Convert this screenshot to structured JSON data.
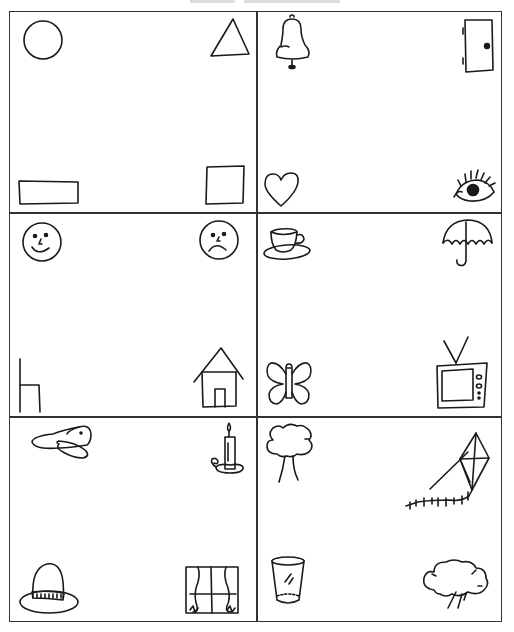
{
  "worksheet": {
    "layout": {
      "rows": 3,
      "columns": 2
    },
    "cells": [
      {
        "position": "row1-left",
        "items": [
          {
            "corner": "top-left",
            "name": "circle"
          },
          {
            "corner": "top-right",
            "name": "triangle"
          },
          {
            "corner": "bottom-left",
            "name": "rectangle"
          },
          {
            "corner": "bottom-right",
            "name": "square"
          }
        ]
      },
      {
        "position": "row1-right",
        "items": [
          {
            "corner": "top-left",
            "name": "bell"
          },
          {
            "corner": "top-right",
            "name": "door"
          },
          {
            "corner": "bottom-left",
            "name": "heart"
          },
          {
            "corner": "bottom-right",
            "name": "eye"
          }
        ]
      },
      {
        "position": "row2-left",
        "items": [
          {
            "corner": "top-left",
            "name": "happy face"
          },
          {
            "corner": "top-right",
            "name": "sad face"
          },
          {
            "corner": "bottom-left",
            "name": "chair"
          },
          {
            "corner": "bottom-right",
            "name": "house"
          }
        ]
      },
      {
        "position": "row2-right",
        "items": [
          {
            "corner": "top-left",
            "name": "teacup"
          },
          {
            "corner": "top-right",
            "name": "umbrella"
          },
          {
            "corner": "bottom-left",
            "name": "butterfly"
          },
          {
            "corner": "bottom-right",
            "name": "television"
          }
        ]
      },
      {
        "position": "row3-left",
        "items": [
          {
            "corner": "top-left",
            "name": "airplane"
          },
          {
            "corner": "top-right",
            "name": "candle"
          },
          {
            "corner": "bottom-left",
            "name": "hat"
          },
          {
            "corner": "bottom-right",
            "name": "window"
          }
        ]
      },
      {
        "position": "row3-right",
        "items": [
          {
            "corner": "top-left",
            "name": "tree"
          },
          {
            "corner": "top-right",
            "name": "kite"
          },
          {
            "corner": "bottom-left",
            "name": "glass"
          },
          {
            "corner": "bottom-right",
            "name": "rain cloud"
          }
        ]
      }
    ],
    "colors": {
      "line": "#333333",
      "ink": "#1a1a1a",
      "paper": "#ffffff"
    }
  }
}
